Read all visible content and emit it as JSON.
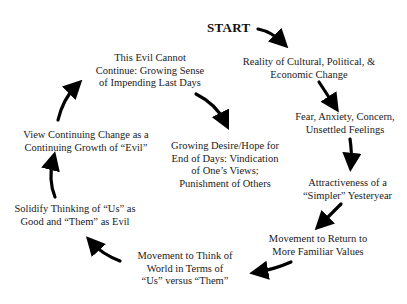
{
  "diagram": {
    "type": "cycle",
    "start_label": "START",
    "nodes": [
      {
        "id": "n1",
        "lines": [
          "Reality of Cultural, Political, &",
          "Economic Change"
        ]
      },
      {
        "id": "n2",
        "lines": [
          "Fear, Anxiety, Concern,",
          "Unsettled Feelings"
        ]
      },
      {
        "id": "n3",
        "lines": [
          "Attractiveness of a",
          "“Simpler” Yesteryear"
        ]
      },
      {
        "id": "n4",
        "lines": [
          "Movement to Return to",
          "More Familiar Values"
        ]
      },
      {
        "id": "n5",
        "lines": [
          "Movement to Think of",
          "World in Terms of",
          "“Us” versus “Them”"
        ]
      },
      {
        "id": "n6",
        "lines": [
          "Solidify Thinking of “Us” as",
          "Good and “Them” as Evil"
        ]
      },
      {
        "id": "n7",
        "lines": [
          "View Continuing Change as a",
          "Continuing Growth of “Evil”"
        ]
      },
      {
        "id": "n8",
        "lines": [
          "This Evil Cannot",
          "Continue: Growing Sense",
          "of Impending Last Days"
        ]
      },
      {
        "id": "n9",
        "lines": [
          "Growing Desire/Hope for",
          "End of Days: Vindication",
          "of One’s Views;",
          "Punishment of Others"
        ]
      }
    ],
    "edges": [
      [
        "START",
        "n1"
      ],
      [
        "n1",
        "n2"
      ],
      [
        "n2",
        "n3"
      ],
      [
        "n3",
        "n4"
      ],
      [
        "n4",
        "n5"
      ],
      [
        "n5",
        "n6"
      ],
      [
        "n6",
        "n7"
      ],
      [
        "n7",
        "n8"
      ],
      [
        "n8",
        "n9"
      ]
    ],
    "colors": {
      "text": "#1a1a1a",
      "arrow": "#000000",
      "background": "#ffffff"
    }
  }
}
